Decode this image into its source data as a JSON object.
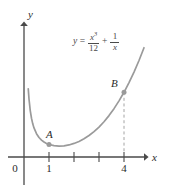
{
  "figure": {
    "background_color": "#ffffff",
    "curve_color": "#9a9a9a",
    "axis_color": "#4a4a4a",
    "text_color": "#2b2b2b",
    "point_color": "#9a9a9a"
  },
  "axes": {
    "x_label": "x",
    "y_label": "y",
    "origin_label": "0",
    "x_ticks": [
      {
        "value": 1,
        "label": "1",
        "labeled": true
      },
      {
        "value": 2,
        "label": "",
        "labeled": false
      },
      {
        "value": 3,
        "label": "",
        "labeled": false
      },
      {
        "value": 4,
        "label": "4",
        "labeled": true
      }
    ],
    "y_ticks": []
  },
  "equation": {
    "lhs": "y",
    "equals": "=",
    "term1_numerator": "x",
    "term1_numerator_exponent": "3",
    "term1_denominator": "12",
    "plus": "+",
    "term2_numerator": "1",
    "term2_denominator": "x",
    "plain_text": "y = x^3/12 + 1/x"
  },
  "points": [
    {
      "name": "A",
      "label": "A",
      "x": 1,
      "y": 1.083
    },
    {
      "name": "B",
      "label": "B",
      "x": 4,
      "y": 5.583
    }
  ],
  "annotations": {
    "dashed_dropline_from": "B",
    "dashed_dropline_to_x": 4
  },
  "chart_data": {
    "type": "line",
    "title": "",
    "xlabel": "x",
    "ylabel": "y",
    "function": "y = x^3/12 + 1/x",
    "xlim": [
      0,
      5.2
    ],
    "ylim": [
      0,
      7.2
    ],
    "grid": false,
    "legend": "none",
    "series": [
      {
        "name": "y = x^3/12 + 1/x",
        "color": "#9a9a9a",
        "x": [
          0.17,
          0.2,
          0.25,
          0.3,
          0.35,
          0.4,
          0.5,
          0.6,
          0.7,
          0.8,
          0.9,
          1.0,
          1.2,
          1.4,
          1.6,
          1.8,
          2.0,
          2.2,
          2.4,
          2.6,
          2.8,
          3.0,
          3.2,
          3.4,
          3.6,
          3.8,
          4.0,
          4.2,
          4.4,
          4.6,
          4.8
        ],
        "y": [
          5.88,
          5.0,
          4.0,
          3.34,
          2.86,
          2.51,
          2.01,
          1.68,
          1.46,
          1.29,
          1.17,
          1.08,
          0.98,
          0.94,
          0.96,
          1.04,
          1.17,
          1.34,
          1.57,
          1.85,
          2.19,
          2.58,
          3.04,
          3.57,
          4.17,
          4.84,
          5.58,
          6.42,
          7.32,
          8.32,
          9.42
        ]
      }
    ],
    "markers": [
      {
        "label": "A",
        "x": 1,
        "y": 1.083
      },
      {
        "label": "B",
        "x": 4,
        "y": 5.583
      }
    ]
  }
}
